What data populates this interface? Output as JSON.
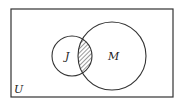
{
  "diagram": {
    "type": "venn",
    "universe": {
      "label": "U",
      "x": 11,
      "y": 9,
      "width": 162,
      "height": 88
    },
    "sets": [
      {
        "label": "J",
        "cx": 72,
        "cy": 56,
        "r": 20
      },
      {
        "label": "M",
        "cx": 112,
        "cy": 56,
        "r": 34
      }
    ],
    "shaded_region": "J ∩ M",
    "colors": {
      "stroke": "#333333",
      "background": "#ffffff",
      "hatch": "#333333"
    }
  }
}
